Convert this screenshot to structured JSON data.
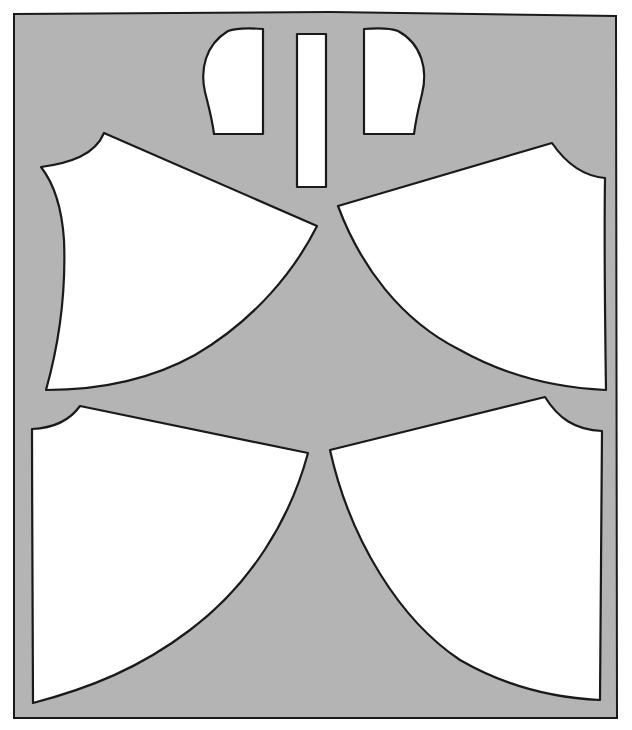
{
  "diagram": {
    "type": "sewing-pattern-layout",
    "colors": {
      "fabric": "#b4b4b4",
      "piece": "#ffffff",
      "outline": "#1a1a1a",
      "background": "#ffffff"
    },
    "fabric": {
      "label": "fabric-layout"
    },
    "pieces": [
      {
        "id": "pocket-left",
        "label": "pocket-left"
      },
      {
        "id": "waistband-strip",
        "label": "waistband-strip"
      },
      {
        "id": "pocket-right",
        "label": "pocket-right"
      },
      {
        "id": "upper-left-panel",
        "label": "upper-left-panel"
      },
      {
        "id": "upper-right-panel",
        "label": "upper-right-panel"
      },
      {
        "id": "lower-left-panel",
        "label": "lower-left-panel"
      },
      {
        "id": "lower-right-panel",
        "label": "lower-right-panel"
      }
    ]
  }
}
